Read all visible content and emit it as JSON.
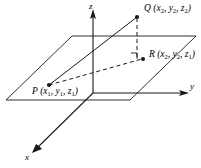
{
  "figure": {
    "type": "3d-coordinate-diagram",
    "background_color": "#ffffff",
    "line_color": "#1a1a1a",
    "axes": [
      {
        "id": "x",
        "label": "x"
      },
      {
        "id": "y",
        "label": "y"
      },
      {
        "id": "z",
        "label": "z"
      }
    ],
    "points": [
      {
        "id": "P",
        "name": "P",
        "label_name": "P",
        "coords": [
          "x",
          "y",
          "z"
        ],
        "subscripts": [
          "1",
          "1",
          "1"
        ]
      },
      {
        "id": "Q",
        "name": "Q",
        "label_name": "Q",
        "coords": [
          "x",
          "y",
          "z"
        ],
        "subscripts": [
          "2",
          "2",
          "2"
        ]
      },
      {
        "id": "R",
        "name": "R",
        "label_name": "R",
        "coords": [
          "x",
          "y",
          "z"
        ],
        "subscripts": [
          "2",
          "2",
          "1"
        ]
      }
    ],
    "labels": {
      "axis_x": "x",
      "axis_y": "y",
      "axis_z": "z",
      "point_P_name": "P",
      "point_Q_name": "Q",
      "point_R_name": "R",
      "paren_open": "(",
      "paren_close": ")",
      "comma": ", ",
      "var_x": "x",
      "var_y": "y",
      "var_z": "z",
      "sub_1": "1",
      "sub_2": "2"
    }
  }
}
